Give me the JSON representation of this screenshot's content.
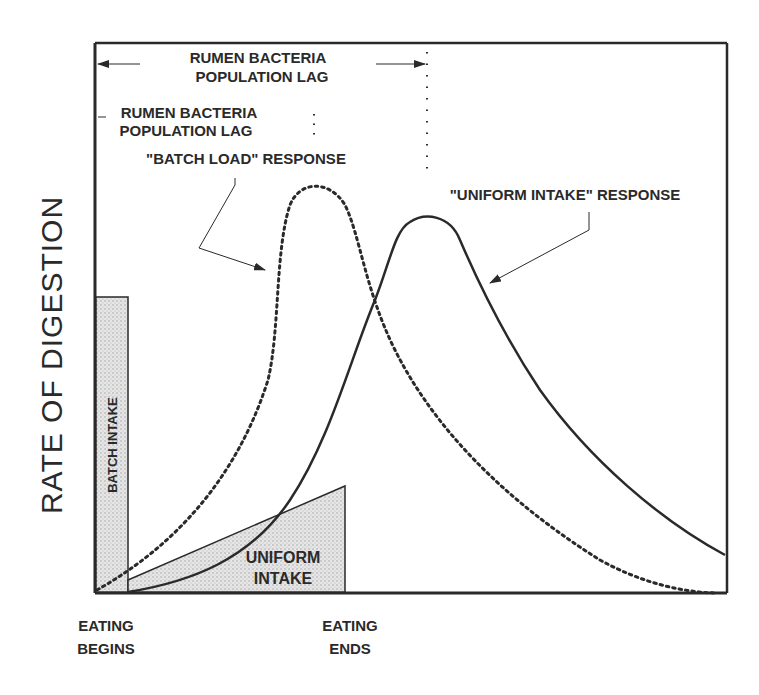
{
  "figure": {
    "y_axis_label": "RATE OF DIGESTION",
    "lag_outer": {
      "line1": "RUMEN BACTERIA",
      "line2": "POPULATION LAG"
    },
    "lag_inner": {
      "line1": "RUMEN BACTERIA",
      "line2": "POPULATION LAG"
    },
    "batch_response_label": "\"BATCH LOAD\" RESPONSE",
    "uniform_response_label": "\"UNIFORM INTAKE\" RESPONSE",
    "batch_intake_label": "BATCH INTAKE",
    "uniform_intake": {
      "line1": "UNIFORM",
      "line2": "INTAKE"
    },
    "x_start": {
      "line1": "EATING",
      "line2": "BEGINS"
    },
    "x_end": {
      "line1": "EATING",
      "line2": "ENDS"
    }
  },
  "colors": {
    "ink": "#2a2a2a",
    "shade": "#d8d8d8",
    "background": "#ffffff"
  }
}
